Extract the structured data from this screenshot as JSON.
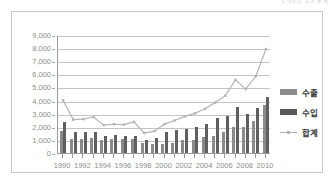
{
  "top_note": "무역수지 추이 통계",
  "legend": {
    "position": "right",
    "items": [
      {
        "label": "수출",
        "marker": "bar-swatch-light",
        "color": "#8a8a8a"
      },
      {
        "label": "수입",
        "marker": "bar-swatch-dark",
        "color": "#5a5a5a"
      },
      {
        "label": "합계",
        "marker": "line-swatch",
        "color": "#b4b4b4"
      }
    ]
  },
  "chart_data": {
    "type": "bar",
    "title": "",
    "xlabel": "",
    "ylabel": "",
    "ylim": [
      0,
      9000
    ],
    "ytick_step": 1000,
    "ytick_labels": [
      "9,000",
      "8,000",
      "7,000",
      "6,000",
      "5,000",
      "4,000",
      "3,000",
      "2,000",
      "1,000",
      "0"
    ],
    "grid": true,
    "legend_position": "right",
    "categories": [
      "1990",
      "1991",
      "1992",
      "1993",
      "1994",
      "1995",
      "1996",
      "1997",
      "1998",
      "1999",
      "2000",
      "2001",
      "2002",
      "2003",
      "2004",
      "2005",
      "2006",
      "2007",
      "2008",
      "2009",
      "2010"
    ],
    "xtick_labels": [
      "1990",
      "1992",
      "1994",
      "1996",
      "1998",
      "2000",
      "2002",
      "2004",
      "2006",
      "2008",
      "2010"
    ],
    "series": [
      {
        "name": "수출",
        "type": "bar",
        "color": "#8a8a8a",
        "values": [
          1700,
          1050,
          1080,
          1120,
          1000,
          1090,
          1060,
          1100,
          800,
          650,
          700,
          780,
          1000,
          1020,
          1230,
          1300,
          1600,
          2020,
          2010,
          2450,
          3700
        ]
      },
      {
        "name": "수입",
        "type": "bar",
        "color": "#5f5f5f",
        "values": [
          2350,
          1580,
          1570,
          1620,
          1280,
          1360,
          1300,
          1330,
          980,
          1120,
          1620,
          1770,
          1830,
          1960,
          2200,
          2650,
          2830,
          3520,
          3010,
          3460,
          4300
        ]
      },
      {
        "name": "합계",
        "type": "line",
        "color": "#b4b4b4",
        "values": [
          4100,
          2620,
          2660,
          2820,
          2200,
          2270,
          2240,
          2450,
          1600,
          1740,
          2280,
          2560,
          2870,
          3100,
          3450,
          3920,
          4450,
          5650,
          4950,
          5930,
          8000
        ]
      }
    ]
  }
}
